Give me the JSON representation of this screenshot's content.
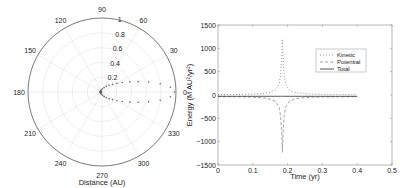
{
  "chart_data": [
    {
      "type": "scatter",
      "subtype": "polar",
      "title": "",
      "xlabel": "Distance (AU)",
      "radial_ticks": [
        "0.2",
        "0.4",
        "0.6",
        "0.8",
        "1"
      ],
      "radial_range": [
        0,
        1
      ],
      "angle_ticks": [
        "0",
        "30",
        "60",
        "90",
        "120",
        "150",
        "180",
        "210",
        "240",
        "270",
        "300",
        "330"
      ],
      "grid": true,
      "series": [
        {
          "name": "Orbit",
          "style": "dotted",
          "eccentricity": 0.96,
          "semi_major_axis_au": 0.5,
          "points_theta_deg": [
            0,
            4,
            8,
            12,
            16,
            20,
            25,
            30,
            36,
            43,
            52,
            65,
            85,
            110,
            140,
            165,
            180,
            195,
            220,
            250,
            275,
            295,
            308,
            317,
            324,
            330,
            335,
            340,
            344,
            348,
            352,
            356
          ]
        }
      ]
    },
    {
      "type": "line",
      "title": "",
      "xlabel": "Time (yr)",
      "ylabel": "Energy (M AU²/yr²)",
      "xlim": [
        0,
        0.5
      ],
      "ylim": [
        -1500,
        1500
      ],
      "xticks": [
        "0",
        "0.1",
        "0.2",
        "0.3",
        "0.4",
        "0.5"
      ],
      "yticks": [
        "-1500",
        "-1000",
        "-500",
        "0",
        "500",
        "1000",
        "1500"
      ],
      "legend_placement": "top-right",
      "grid": false,
      "x": [
        0,
        0.05,
        0.1,
        0.13,
        0.15,
        0.165,
        0.175,
        0.18,
        0.183,
        0.185,
        0.187,
        0.19,
        0.195,
        0.205,
        0.22,
        0.24,
        0.27,
        0.3,
        0.35,
        0.4
      ],
      "series": [
        {
          "name": "Kinetic",
          "style": "dotted",
          "values": [
            8,
            10,
            18,
            35,
            60,
            110,
            220,
            420,
            800,
            1200,
            800,
            420,
            220,
            110,
            60,
            35,
            20,
            14,
            10,
            8
          ]
        },
        {
          "name": "Potential",
          "style": "dashed",
          "values": [
            -36,
            -38,
            -46,
            -63,
            -88,
            -138,
            -248,
            -448,
            -828,
            -1228,
            -828,
            -448,
            -248,
            -138,
            -88,
            -63,
            -48,
            -42,
            -38,
            -36
          ]
        },
        {
          "name": "Total",
          "style": "solid",
          "values": [
            -28,
            -28,
            -28,
            -28,
            -28,
            -28,
            -28,
            -28,
            -28,
            -28,
            -28,
            -28,
            -28,
            -28,
            -28,
            -28,
            -28,
            -28,
            -28,
            -28
          ]
        }
      ]
    }
  ]
}
